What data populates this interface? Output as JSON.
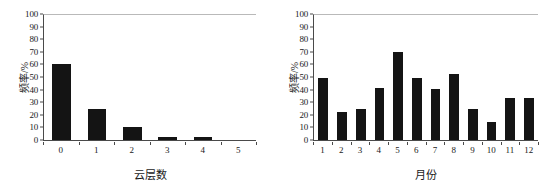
{
  "figure": {
    "background": "#ffffff",
    "bar_color": "#141414",
    "axis_color": "#4a4a4a"
  },
  "chart_data": [
    {
      "type": "bar",
      "title": "",
      "subtitle": "",
      "xlabel": "云层数",
      "ylabel": "频率/%",
      "categories": [
        "0",
        "1",
        "2",
        "3",
        "4",
        "5"
      ],
      "values": [
        60.5,
        24.5,
        10.5,
        2.5,
        2.5,
        0
      ],
      "ylim": [
        0,
        100
      ],
      "yticks": [
        0,
        10,
        20,
        30,
        40,
        50,
        60,
        70,
        80,
        90,
        100
      ],
      "ytick_labels": [
        "0",
        "10",
        "20",
        "30",
        "40",
        "50",
        "60",
        "70",
        "80",
        "90",
        "100"
      ],
      "grid": false,
      "legend": null,
      "annotations": []
    },
    {
      "type": "bar",
      "title": "",
      "subtitle": "",
      "xlabel": "月份",
      "ylabel": "频率/%",
      "categories": [
        "1",
        "2",
        "3",
        "4",
        "5",
        "6",
        "7",
        "8",
        "9",
        "10",
        "11",
        "12"
      ],
      "values": [
        49.5,
        22.5,
        24.5,
        41.5,
        70.0,
        49.5,
        40.5,
        52.5,
        24.5,
        14.0,
        33.0,
        33.0
      ],
      "ylim": [
        0,
        100
      ],
      "yticks": [
        0,
        10,
        20,
        30,
        40,
        50,
        60,
        70,
        80,
        90,
        100
      ],
      "ytick_labels": [
        "0",
        "10",
        "20",
        "30",
        "40",
        "50",
        "60",
        "70",
        "80",
        "90",
        "100"
      ],
      "grid": false,
      "legend": null,
      "annotations": []
    }
  ]
}
